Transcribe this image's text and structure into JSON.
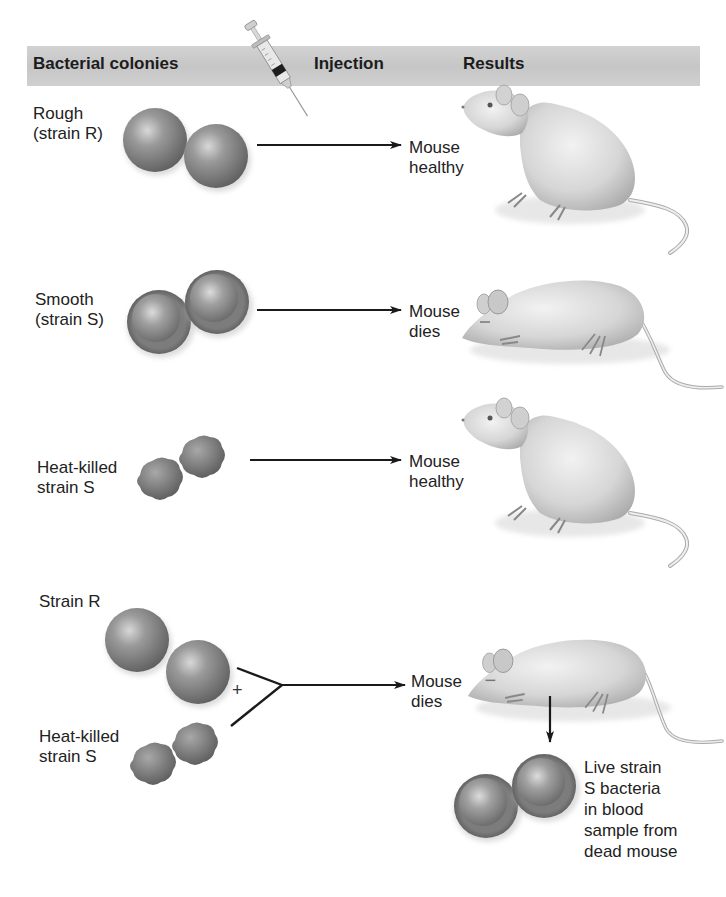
{
  "header": {
    "columns": [
      "Bacterial colonies",
      "Injection",
      "Results"
    ]
  },
  "rows": [
    {
      "colony_label": "Rough\n(strain R)",
      "colony_type": "rough-live",
      "result_label": "Mouse\nhealthy",
      "mouse_state": "healthy"
    },
    {
      "colony_label": "Smooth\n(strain S)",
      "colony_type": "smooth-capsule",
      "result_label": "Mouse\ndies",
      "mouse_state": "dead"
    },
    {
      "colony_label": "Heat-killed\nstrain S",
      "colony_type": "heat-killed",
      "result_label": "Mouse\nhealthy",
      "mouse_state": "healthy"
    },
    {
      "colony_label_top": "Strain R",
      "colony_label_bottom": "Heat-killed\nstrain S",
      "combine_symbol": "+",
      "result_label": "Mouse\ndies",
      "mouse_state": "dead",
      "blood_sample_label": "Live strain\nS bacteria\nin blood\nsample from\ndead mouse"
    }
  ],
  "icons": {
    "injection": "syringe-icon",
    "healthy_mouse": "mouse-healthy-icon",
    "dead_mouse": "mouse-dead-icon"
  },
  "colors": {
    "header_band": "#cacaca",
    "text": "#1a1a1a",
    "bacteria_fill": "#8a8a8a",
    "arrow": "#1a1a1a"
  }
}
